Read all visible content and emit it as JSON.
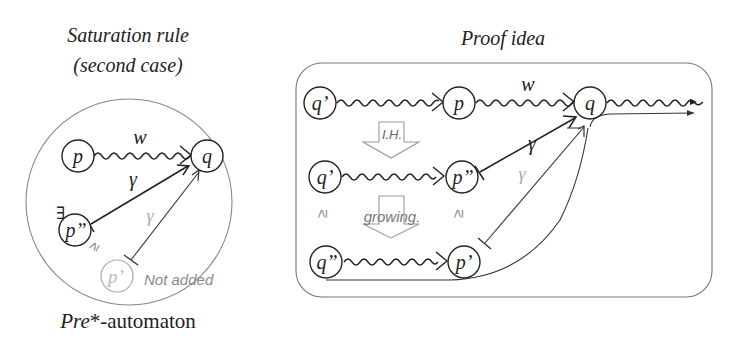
{
  "left_panel": {
    "title_line1": "Saturation rule",
    "title_line2": "(second case)",
    "caption_prefix": "Pre",
    "caption_suffix": "*-automaton",
    "nodes": {
      "p": "p",
      "q": "q",
      "p_dd": "p”",
      "p_d": "p’"
    },
    "labels": {
      "w": "w",
      "gamma_black": "γ",
      "gamma_gray": "γ",
      "exists": "∃",
      "geq": "≥",
      "not_added": "Not added"
    }
  },
  "right_panel": {
    "title": "Proof idea",
    "nodes": {
      "row1_q_d": "q’",
      "row1_p": "p",
      "row1_q": "q",
      "row2_q_d": "q’",
      "row2_p_dd": "p”",
      "row3_q_dd": "q”",
      "row3_p_d": "p’"
    },
    "labels": {
      "w": "w",
      "gamma_black": "γ",
      "gamma_gray": "γ",
      "ih": "I.H.",
      "growing": "growing.",
      "geq_left": "≥",
      "geq_right": "≥"
    }
  },
  "colors": {
    "stroke": "#222222",
    "gray": "#aaaaaa",
    "frame": "#777777"
  }
}
